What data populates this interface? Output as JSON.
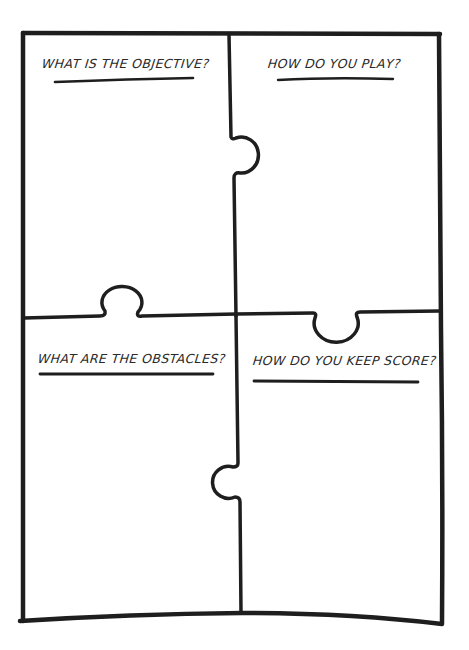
{
  "worksheet": {
    "type": "puzzle-piece game design worksheet",
    "colors": {
      "ink": "#1e1e1e",
      "background": "#ffffff",
      "text": "#2a2a2a"
    },
    "quadrants": [
      {
        "position": "top-left",
        "prompt": "WHAT IS THE OBJECTIVE?"
      },
      {
        "position": "top-right",
        "prompt": "HOW DO YOU PLAY?"
      },
      {
        "position": "bottom-left",
        "prompt": "WHAT ARE THE OBSTACLES?"
      },
      {
        "position": "bottom-right",
        "prompt": "HOW DO YOU KEEP SCORE?"
      }
    ]
  }
}
